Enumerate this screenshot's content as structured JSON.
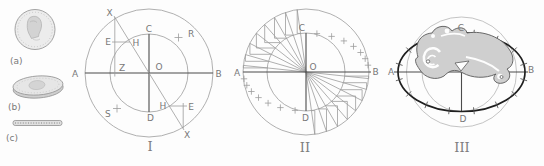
{
  "figure": {
    "colors": {
      "paper": "#fdfdfd",
      "line_light": "#9c9c9c",
      "line_dark": "#4b4b4b",
      "ellipse_bold": "#1f1f1f",
      "label": "#787878",
      "ornament_fill": "#cfcfcf"
    }
  },
  "coins": {
    "front_label": "(a)",
    "tilted_label": "(b)",
    "edge_label": "(c)"
  },
  "diagrams": {
    "one": {
      "numeral": "I",
      "labels": {
        "A": "A",
        "B": "B",
        "C": "C",
        "D": "D",
        "O": "O",
        "Z": "Z",
        "E": "E",
        "H": "H",
        "X": "X",
        "R": "R",
        "S": "S"
      }
    },
    "two": {
      "numeral": "II",
      "labels": {
        "A": "A",
        "B": "B",
        "C": "C",
        "D": "D",
        "O": "O"
      }
    },
    "three": {
      "numeral": "III",
      "labels": {
        "A": "A",
        "B": "B",
        "C": "C",
        "D": "D"
      }
    }
  }
}
